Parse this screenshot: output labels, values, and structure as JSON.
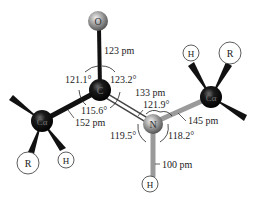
{
  "diagram": {
    "atoms": {
      "oxygen": "O",
      "carbonyl_carbon": "C",
      "nitrogen": "N",
      "alpha_carbon_left": "Cα",
      "alpha_carbon_right": "Cα",
      "hydrogen_left": "H",
      "hydrogen_right": "H",
      "hydrogen_amide": "H",
      "r_group_left": "R",
      "r_group_right": "R"
    },
    "bond_lengths": {
      "c_o": "123 pm",
      "c_n": "133 pm",
      "calpha_c": "152 pm",
      "n_calpha": "145 pm",
      "n_h": "100 pm"
    },
    "bond_angles": {
      "calpha_c_o": "121.1°",
      "o_c_n": "123.2°",
      "calpha_c_n": "115.6°",
      "c_n_h": "119.5°",
      "c_n_calpha": "121.9°",
      "calpha_n_h": "118.2°"
    },
    "colors": {
      "carbon": "#111111",
      "oxygen_nitrogen": "#8a8a8a",
      "bond_dark": "#111111",
      "bond_gray": "#9a9a9a",
      "label": "#222222"
    }
  }
}
